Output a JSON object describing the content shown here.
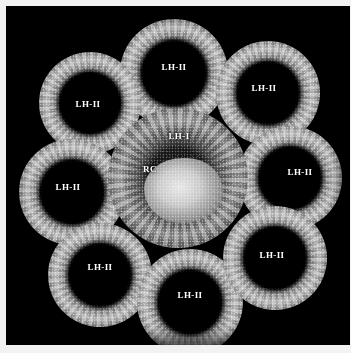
{
  "figure": {
    "background_color": "#000000",
    "margin_color": "#f2f2f2",
    "label_color": "#ffffff",
    "panel": {
      "x": 6,
      "y": 6,
      "width": 344,
      "height": 339
    }
  },
  "complexes": [
    {
      "id": "lh2-top",
      "label": "LH-II",
      "cx": 174,
      "cy": 73,
      "d": 108,
      "label_x": 174,
      "label_y": 67
    },
    {
      "id": "lh2-top-left",
      "label": "LH-II",
      "cx": 90,
      "cy": 103,
      "d": 102,
      "label_x": 88,
      "label_y": 104
    },
    {
      "id": "lh2-top-right",
      "label": "LH-II",
      "cx": 268,
      "cy": 93,
      "d": 104,
      "label_x": 264,
      "label_y": 88
    },
    {
      "id": "lh2-left",
      "label": "LH-II",
      "cx": 72,
      "cy": 192,
      "d": 106,
      "label_x": 68,
      "label_y": 187
    },
    {
      "id": "lh2-right",
      "label": "LH-II",
      "cx": 290,
      "cy": 178,
      "d": 104,
      "label_x": 300,
      "label_y": 172
    },
    {
      "id": "lh2-bottom-left",
      "label": "LH-II",
      "cx": 100,
      "cy": 275,
      "d": 104,
      "label_x": 100,
      "label_y": 267
    },
    {
      "id": "lh2-bottom",
      "label": "LH-II",
      "cx": 190,
      "cy": 302,
      "d": 106,
      "label_x": 190,
      "label_y": 295
    },
    {
      "id": "lh2-bottom-right",
      "label": "LH-II",
      "cx": 275,
      "cy": 258,
      "d": 104,
      "label_x": 272,
      "label_y": 255
    }
  ],
  "core": {
    "id": "lhi-rc",
    "cx": 178,
    "cy": 178,
    "d": 140,
    "lhi_label": "LH-I",
    "lhi_label_x": 179,
    "lhi_label_y": 136,
    "rc_label": "RC",
    "rc_label_x": 150,
    "rc_label_y": 169
  }
}
